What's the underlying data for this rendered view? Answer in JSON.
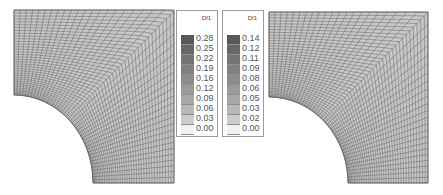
{
  "figure": {
    "panels": [
      {
        "name": "left-mesh",
        "description": "Quarter plate with circular hole, deformed FE mesh"
      },
      {
        "name": "right-mesh",
        "description": "Quarter plate with circular hole, deformed FE mesh"
      }
    ],
    "legends": [
      {
        "title": "Df1",
        "labels": [
          "0.28",
          "0.25",
          "0.22",
          "0.19",
          "0.16",
          "0.12",
          "0.09",
          "0.06",
          "0.03",
          "0.00"
        ],
        "colors": [
          "#585858",
          "#676767",
          "#747474",
          "#808080",
          "#8c8c8c",
          "#9a9a9a",
          "#a8a8a8",
          "#b8b8b8",
          "#cccccc",
          "#f2f2f2"
        ]
      },
      {
        "title": "Df1",
        "labels": [
          "0.14",
          "0.12",
          "0.11",
          "0.09",
          "0.08",
          "0.06",
          "0.05",
          "0.03",
          "0.02",
          "0.00"
        ],
        "colors": [
          "#585858",
          "#676767",
          "#747474",
          "#808080",
          "#8c8c8c",
          "#9a9a9a",
          "#a8a8a8",
          "#b8b8b8",
          "#cccccc",
          "#f2f2f2"
        ]
      }
    ],
    "colors": {
      "mesh_line": "#5a5a5a",
      "mesh_fill": "#c8c8c8",
      "mesh_fill_corner": "#d8d8d8",
      "legend_border": "#9a9a9a"
    }
  }
}
